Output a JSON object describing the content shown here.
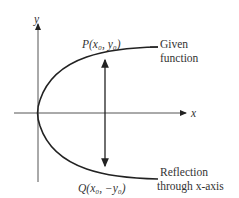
{
  "diagram": {
    "axes": {
      "x_label": "x",
      "y_label": "y"
    },
    "point_p": {
      "label": "P(x₀, y₀)"
    },
    "point_q": {
      "label": "Q(x₀, −y₀)"
    },
    "annotations": {
      "given": [
        "Given",
        "function"
      ],
      "reflection": [
        "Reflection",
        "through x-axis"
      ]
    },
    "colors": {
      "line": "#222222",
      "axis": "#555555",
      "text": "#333333"
    }
  }
}
